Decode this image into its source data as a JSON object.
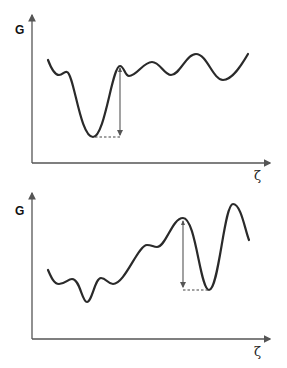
{
  "panels": [
    {
      "id": "top",
      "y_axis_label": "G",
      "x_axis_label": "ζ",
      "description": "Free energy landscape with deep minimum on left side; arrow marks barrier height from deep minimum to adjacent peak",
      "curve_points": [
        [
          48,
          60
        ],
        [
          59,
          75
        ],
        [
          67,
          72
        ],
        [
          93,
          137
        ],
        [
          120,
          66
        ],
        [
          129,
          76
        ],
        [
          152,
          62
        ],
        [
          171,
          75
        ],
        [
          196,
          54
        ],
        [
          223,
          80
        ],
        [
          248,
          54
        ]
      ],
      "barrier_arrow": {
        "x": 120,
        "from_y": 68,
        "to_y": 136
      },
      "dashed_line": {
        "x1": 95,
        "x2": 120,
        "y": 137
      }
    },
    {
      "id": "bottom",
      "y_axis_label": "G",
      "x_axis_label": "ζ",
      "description": "Free energy landscape with deep minimum on right side; arrow marks barrier height from adjacent peak to deep minimum",
      "curve_points": [
        [
          48,
          270
        ],
        [
          59,
          284
        ],
        [
          72,
          279
        ],
        [
          87,
          302
        ],
        [
          101,
          278
        ],
        [
          113,
          284
        ],
        [
          147,
          245
        ],
        [
          157,
          247
        ],
        [
          183,
          218
        ],
        [
          209,
          290
        ],
        [
          233,
          204
        ],
        [
          249,
          240
        ]
      ],
      "barrier_arrow": {
        "x": 183,
        "from_y": 220,
        "to_y": 289
      },
      "dashed_line": {
        "x1": 183,
        "x2": 209,
        "y": 290
      }
    }
  ]
}
